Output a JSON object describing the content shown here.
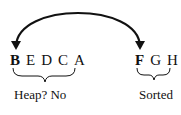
{
  "left_group": {
    "letters": [
      "B",
      "E",
      "D",
      "C",
      "A"
    ],
    "highlighted": "B",
    "label": "Heap?  No"
  },
  "right_group": {
    "letters": [
      "F",
      "G",
      "H"
    ],
    "highlighted": "F",
    "label": "Sorted"
  },
  "arrow": {
    "from": "F",
    "to": "B",
    "style": "curved double-headed swap arrow",
    "color": "#111111"
  }
}
